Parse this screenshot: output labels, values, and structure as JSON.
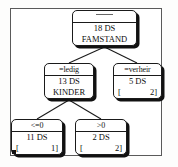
{
  "diagram": {
    "type": "decision-tree",
    "frame_visible": true,
    "nodes": [
      {
        "id": "root",
        "header": "----",
        "header_is_rule": true,
        "count": "18 DS",
        "label": "FAMSTAND",
        "bracket_left": "",
        "bracket_right": "",
        "has_bracket": false
      },
      {
        "id": "ledig",
        "header": "=ledig",
        "header_is_rule": false,
        "count": "13 DS",
        "label": "KINDER",
        "bracket_left": "",
        "bracket_right": "",
        "has_bracket": false
      },
      {
        "id": "verheir",
        "header": "=verheir",
        "header_is_rule": false,
        "count": "5 DS",
        "label": "",
        "bracket_left": "[",
        "bracket_right": "2]",
        "has_bracket": true
      },
      {
        "id": "le0",
        "header": "<=0",
        "header_is_rule": false,
        "count": "11 DS",
        "label": "",
        "bracket_left": "[",
        "bracket_right": "1]",
        "has_bracket": true
      },
      {
        "id": "gt0",
        "header": ">0",
        "header_is_rule": false,
        "count": "2 DS",
        "label": "",
        "bracket_left": "[",
        "bracket_right": "2]",
        "has_bracket": true
      }
    ],
    "edges": [
      {
        "from": "root",
        "to": "ledig"
      },
      {
        "from": "root",
        "to": "verheir"
      },
      {
        "from": "ledig",
        "to": "le0"
      },
      {
        "from": "ledig",
        "to": "gt0"
      }
    ],
    "colors": {
      "node_border": "#1a1a1a",
      "node_fill": "#ffffff",
      "node_shadow": "#111111",
      "edge": "#1a1a1a",
      "frame": "#5a5a5a",
      "text": "#0d0d0d"
    }
  }
}
